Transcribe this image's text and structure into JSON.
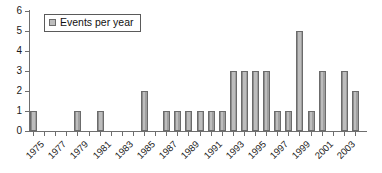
{
  "chart_data": {
    "type": "bar",
    "title": "",
    "xlabel": "",
    "ylabel": "",
    "ylim": [
      0,
      6
    ],
    "yticks": [
      0,
      1,
      2,
      3,
      4,
      5,
      6
    ],
    "grid": false,
    "legend_position": "top-left",
    "legend": [
      "Events per year"
    ],
    "categories": [
      "1975",
      "1976",
      "1977",
      "1978",
      "1979",
      "1980",
      "1981",
      "1982",
      "1983",
      "1984",
      "1985",
      "1986",
      "1987",
      "1988",
      "1989",
      "1990",
      "1991",
      "1992",
      "1993",
      "1994",
      "1995",
      "1996",
      "1997",
      "1998",
      "1999",
      "2000",
      "2001",
      "2002",
      "2003",
      "2004"
    ],
    "values": [
      1,
      0,
      0,
      0,
      1,
      0,
      1,
      0,
      0,
      0,
      2,
      0,
      1,
      1,
      1,
      1,
      1,
      1,
      3,
      3,
      3,
      3,
      1,
      1,
      5,
      1,
      3,
      0,
      3,
      2
    ],
    "tick_labels": [
      "1975",
      "1977",
      "1979",
      "1981",
      "1983",
      "1985",
      "1987",
      "1989",
      "1991",
      "1993",
      "1995",
      "1997",
      "1999",
      "2001",
      "2003"
    ],
    "series": [
      {
        "name": "Events per year",
        "color": "#bdbdbd",
        "values": [
          1,
          0,
          0,
          0,
          1,
          0,
          1,
          0,
          0,
          0,
          2,
          0,
          1,
          1,
          1,
          1,
          1,
          1,
          3,
          3,
          3,
          3,
          1,
          1,
          5,
          1,
          3,
          0,
          3,
          2
        ]
      }
    ]
  },
  "legend": {
    "label": "Events per year",
    "swatch_color": "#bdbdbd"
  },
  "axes": {
    "y_labels": [
      "6",
      "5",
      "4",
      "3",
      "2",
      "1",
      "0"
    ],
    "x_labels": [
      "1975",
      "1977",
      "1979",
      "1981",
      "1983",
      "1985",
      "1987",
      "1989",
      "1991",
      "1993",
      "1995",
      "1997",
      "1999",
      "2001",
      "2003"
    ]
  }
}
